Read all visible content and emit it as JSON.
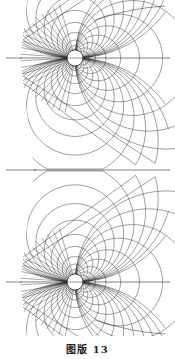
{
  "figure": {
    "caption": "图版 13",
    "line_color": "#2a2a2a",
    "background": "#ffffff"
  }
}
